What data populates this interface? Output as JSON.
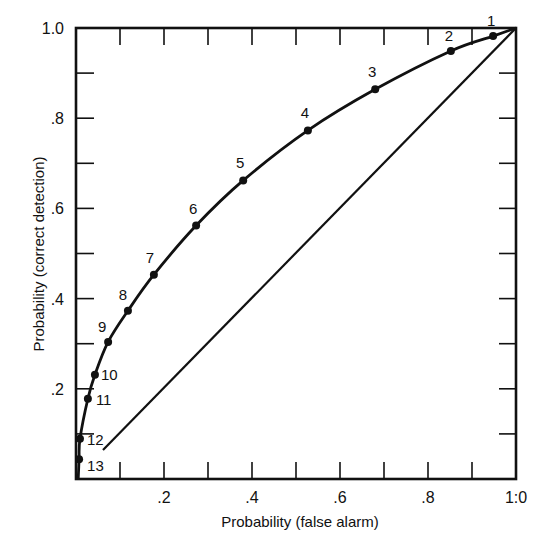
{
  "chart_data": {
    "type": "line",
    "title": "",
    "xlabel": "Probability  (false alarm)",
    "ylabel": "Probability  (correct detection)",
    "xlim": [
      0,
      1.0
    ],
    "ylim": [
      0,
      1.0
    ],
    "x_tick_labels": [
      ".2",
      ".4",
      ".6",
      ".8",
      "1:0"
    ],
    "x_tick_values": [
      0.2,
      0.4,
      0.6,
      0.8,
      1.0
    ],
    "y_tick_labels": [
      ".2",
      ".4",
      ".6",
      ".8",
      "1.0"
    ],
    "y_tick_values": [
      0.2,
      0.4,
      0.6,
      0.8,
      1.0
    ],
    "minor_tick_step": 0.1,
    "grid": false,
    "legend": null,
    "series": [
      {
        "name": "ROC curve",
        "style": "solid-with-markers",
        "points": [
          {
            "label": "1",
            "x": 0.948,
            "y": 0.982
          },
          {
            "label": "2",
            "x": 0.852,
            "y": 0.949
          },
          {
            "label": "3",
            "x": 0.68,
            "y": 0.864
          },
          {
            "label": "4",
            "x": 0.527,
            "y": 0.773
          },
          {
            "label": "5",
            "x": 0.38,
            "y": 0.662
          },
          {
            "label": "6",
            "x": 0.273,
            "y": 0.562
          },
          {
            "label": "7",
            "x": 0.177,
            "y": 0.453
          },
          {
            "label": "8",
            "x": 0.118,
            "y": 0.373
          },
          {
            "label": "9",
            "x": 0.073,
            "y": 0.304
          },
          {
            "label": "10",
            "x": 0.043,
            "y": 0.231
          },
          {
            "label": "11",
            "x": 0.027,
            "y": 0.178
          },
          {
            "label": "12",
            "x": 0.009,
            "y": 0.089
          },
          {
            "label": "13",
            "x": 0.007,
            "y": 0.044
          }
        ]
      },
      {
        "name": "Chance diagonal",
        "style": "solid",
        "points": [
          {
            "x": 0.0,
            "y": 0.0
          },
          {
            "x": 1.0,
            "y": 1.0
          }
        ]
      }
    ]
  },
  "labels": {
    "xlabel": "Probability  (false alarm)",
    "ylabel": "Probability  (correct detection)"
  }
}
